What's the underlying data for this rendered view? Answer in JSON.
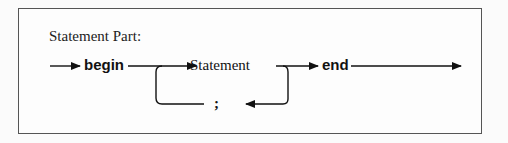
{
  "diagram": {
    "title": "Statement Part:",
    "type": "syntax-diagram",
    "nodes": [
      {
        "id": "begin",
        "label": "begin",
        "kind": "keyword"
      },
      {
        "id": "statement",
        "label": "Statement",
        "kind": "nonterminal"
      },
      {
        "id": "end",
        "label": "end",
        "kind": "keyword"
      },
      {
        "id": "semicolon",
        "label": ";",
        "kind": "terminal"
      }
    ],
    "edges": [
      {
        "from": "start",
        "to": "begin"
      },
      {
        "from": "begin",
        "to": "statement"
      },
      {
        "from": "statement",
        "to": "end"
      },
      {
        "from": "end",
        "to": "exit"
      },
      {
        "from": "statement",
        "to": "semicolon",
        "note": "loop back"
      },
      {
        "from": "semicolon",
        "to": "statement"
      }
    ]
  }
}
